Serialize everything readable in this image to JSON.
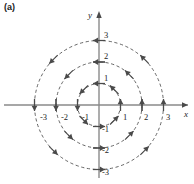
{
  "figure": {
    "panel_label": "(a)",
    "caption": "",
    "background_color": "#ffffff",
    "axis_color": "#8a8a8a",
    "orbit_color": "#555555",
    "arrow_color": "#4a4a4a",
    "text_color": "#1d1d1d"
  },
  "axes": {
    "x_label": "x",
    "y_label": "y",
    "x_ticks": [
      {
        "value": -3,
        "label": "-3"
      },
      {
        "value": -2,
        "label": "-2"
      },
      {
        "value": -1,
        "label": "-1"
      },
      {
        "value": 1,
        "label": "1"
      },
      {
        "value": 2,
        "label": "2"
      },
      {
        "value": 3,
        "label": "3"
      }
    ],
    "y_ticks": [
      {
        "value": 3,
        "label": "3"
      },
      {
        "value": 2,
        "label": "2"
      },
      {
        "value": 1,
        "label": "1"
      },
      {
        "value": -1,
        "label": "-1"
      },
      {
        "value": -2,
        "label": "-2"
      },
      {
        "value": -3,
        "label": "-3"
      }
    ],
    "xlim": [
      -3.6,
      3.6
    ],
    "ylim": [
      -3.6,
      3.6
    ],
    "grid": false
  },
  "chart_data": {
    "type": "scatter",
    "title": "",
    "subtitle": "",
    "xlabel": "x",
    "ylabel": "y",
    "xlim": [
      -3.6,
      3.6
    ],
    "ylim": [
      -3.6,
      3.6
    ],
    "grid": false,
    "legend": null,
    "plot_kind": "phase-portrait",
    "flow_direction": "counterclockwise",
    "orbits": [
      {
        "name": "orbit-r1",
        "shape": "circle",
        "center": [
          0,
          0
        ],
        "radius": 1,
        "style": "dashed"
      },
      {
        "name": "orbit-r2",
        "shape": "circle",
        "center": [
          0,
          0
        ],
        "radius": 2,
        "style": "dashed"
      },
      {
        "name": "orbit-r3",
        "shape": "circle",
        "center": [
          0,
          0
        ],
        "radius": 3,
        "style": "dashed"
      }
    ],
    "arrows": [
      {
        "radius": 1,
        "angle_deg": 0,
        "x": 1.0,
        "y": 0.0,
        "direction_deg": 90
      },
      {
        "radius": 1,
        "angle_deg": 45,
        "x": 0.71,
        "y": 0.71,
        "direction_deg": 135
      },
      {
        "radius": 1,
        "angle_deg": 90,
        "x": 0.0,
        "y": 1.0,
        "direction_deg": 180
      },
      {
        "radius": 1,
        "angle_deg": 135,
        "x": -0.71,
        "y": 0.71,
        "direction_deg": 225
      },
      {
        "radius": 1,
        "angle_deg": 180,
        "x": -1.0,
        "y": 0.0,
        "direction_deg": 270
      },
      {
        "radius": 1,
        "angle_deg": 225,
        "x": -0.71,
        "y": -0.71,
        "direction_deg": 315
      },
      {
        "radius": 1,
        "angle_deg": 270,
        "x": 0.0,
        "y": -1.0,
        "direction_deg": 0
      },
      {
        "radius": 1,
        "angle_deg": 315,
        "x": 0.71,
        "y": -0.71,
        "direction_deg": 45
      },
      {
        "radius": 2,
        "angle_deg": 0,
        "x": 2.0,
        "y": 0.0,
        "direction_deg": 90
      },
      {
        "radius": 2,
        "angle_deg": 45,
        "x": 1.41,
        "y": 1.41,
        "direction_deg": 135
      },
      {
        "radius": 2,
        "angle_deg": 90,
        "x": 0.0,
        "y": 2.0,
        "direction_deg": 180
      },
      {
        "radius": 2,
        "angle_deg": 135,
        "x": -1.41,
        "y": 1.41,
        "direction_deg": 225
      },
      {
        "radius": 2,
        "angle_deg": 180,
        "x": -2.0,
        "y": 0.0,
        "direction_deg": 270
      },
      {
        "radius": 2,
        "angle_deg": 225,
        "x": -1.41,
        "y": -1.41,
        "direction_deg": 315
      },
      {
        "radius": 2,
        "angle_deg": 270,
        "x": 0.0,
        "y": -2.0,
        "direction_deg": 0
      },
      {
        "radius": 2,
        "angle_deg": 315,
        "x": 1.41,
        "y": -1.41,
        "direction_deg": 45
      },
      {
        "radius": 3,
        "angle_deg": 0,
        "x": 3.0,
        "y": 0.0,
        "direction_deg": 90
      },
      {
        "radius": 3,
        "angle_deg": 45,
        "x": 2.12,
        "y": 2.12,
        "direction_deg": 135
      },
      {
        "radius": 3,
        "angle_deg": 90,
        "x": 0.0,
        "y": 3.0,
        "direction_deg": 180
      },
      {
        "radius": 3,
        "angle_deg": 135,
        "x": -2.12,
        "y": 2.12,
        "direction_deg": 225
      },
      {
        "radius": 3,
        "angle_deg": 180,
        "x": -3.0,
        "y": 0.0,
        "direction_deg": 270
      },
      {
        "radius": 3,
        "angle_deg": 225,
        "x": -2.12,
        "y": -2.12,
        "direction_deg": 315
      },
      {
        "radius": 3,
        "angle_deg": 270,
        "x": 0.0,
        "y": -3.0,
        "direction_deg": 0
      },
      {
        "radius": 3,
        "angle_deg": 315,
        "x": 2.12,
        "y": -2.12,
        "direction_deg": 45
      }
    ]
  },
  "geometry": {
    "origin_px": [
      99,
      105
    ],
    "unit_px": 21.5
  }
}
